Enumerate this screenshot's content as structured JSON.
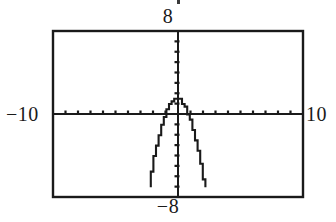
{
  "figure": {
    "kind": "graphing-calculator-plot",
    "background": "#ffffff",
    "ink": "#1a1a1a"
  },
  "labels": {
    "top": "8",
    "bottom": "−8",
    "left": "−10",
    "right": "10"
  },
  "frame": {
    "x": 53,
    "y": 31,
    "width": 250,
    "height": 166,
    "stroke": "#1a1a1a",
    "stroke_width": 2.4
  },
  "chart_data": {
    "type": "line",
    "title": "",
    "xlabel": "",
    "ylabel": "",
    "xlim": [
      -10,
      10
    ],
    "ylim": [
      -8,
      8
    ],
    "xtick_step": 1,
    "ytick_step": 1,
    "grid": false,
    "legend": null,
    "axis_labels_shown": {
      "xmin": "−10",
      "xmax": "10",
      "ymax": "8",
      "ymin": "−8"
    },
    "curve_description": "downward-opening parabola, vertex near (0, 1.5), steeply descending, exits bottom of window near x = ±2.2",
    "series": [
      {
        "name": "parabola",
        "vertex": [
          0,
          1.5
        ],
        "equation_approx": "y = 1.5 - 1.75 x^2",
        "x": [
          -2.2,
          -2.1,
          -2.0,
          -1.9,
          -1.8,
          -1.7,
          -1.6,
          -1.5,
          -1.4,
          -1.3,
          -1.2,
          -1.1,
          -1.0,
          -0.9,
          -0.8,
          -0.7,
          -0.6,
          -0.5,
          -0.4,
          -0.3,
          -0.2,
          -0.1,
          0.0,
          0.1,
          0.2,
          0.3,
          0.4,
          0.5,
          0.6,
          0.7,
          0.8,
          0.9,
          1.0,
          1.1,
          1.2,
          1.3,
          1.4,
          1.5,
          1.6,
          1.7,
          1.8,
          1.9,
          2.0,
          2.1,
          2.2
        ],
        "y": [
          -6.97,
          -6.22,
          -5.5,
          -4.82,
          -4.17,
          -3.56,
          -2.98,
          -2.44,
          -1.93,
          -1.46,
          -1.02,
          -0.62,
          -0.25,
          0.08,
          0.38,
          0.64,
          0.87,
          1.06,
          1.22,
          1.34,
          1.43,
          1.48,
          1.5,
          1.48,
          1.43,
          1.34,
          1.22,
          1.06,
          0.87,
          0.64,
          0.38,
          0.08,
          -0.25,
          -0.62,
          -1.02,
          -1.46,
          -1.93,
          -2.44,
          -2.98,
          -3.56,
          -4.17,
          -4.82,
          -5.5,
          -6.22,
          -6.97
        ]
      }
    ]
  }
}
